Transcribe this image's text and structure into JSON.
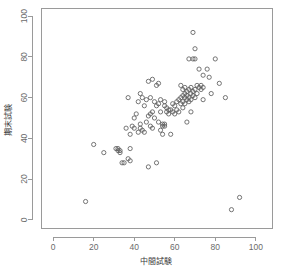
{
  "chart_data": {
    "type": "scatter",
    "title": "",
    "xlabel": "中間試験",
    "ylabel": "期末試験",
    "xlim": [
      -6,
      108
    ],
    "ylim": [
      -4,
      104
    ],
    "xticks": [
      0,
      20,
      40,
      60,
      80,
      100
    ],
    "yticks": [
      0,
      20,
      40,
      60,
      80,
      100
    ],
    "xtick_labels": [
      "0",
      "20",
      "40",
      "60",
      "80",
      "100"
    ],
    "ytick_labels": [
      "0",
      "20",
      "40",
      "60",
      "80",
      "100"
    ],
    "grid": false,
    "legend": false,
    "marker": "open-circle",
    "marker_color": "#5d5d5d",
    "marker_radius": 2.1,
    "n_points": 112,
    "points": [
      [
        16,
        9
      ],
      [
        20,
        37
      ],
      [
        25,
        33
      ],
      [
        31,
        35
      ],
      [
        32,
        35
      ],
      [
        32,
        34
      ],
      [
        33,
        34
      ],
      [
        33,
        33
      ],
      [
        34,
        28
      ],
      [
        35,
        28
      ],
      [
        36,
        45
      ],
      [
        37,
        60
      ],
      [
        37,
        30
      ],
      [
        38,
        35
      ],
      [
        38,
        29
      ],
      [
        38,
        42
      ],
      [
        39,
        46
      ],
      [
        40,
        45
      ],
      [
        40,
        50
      ],
      [
        41,
        52
      ],
      [
        42,
        43
      ],
      [
        42,
        58
      ],
      [
        43,
        62
      ],
      [
        43,
        47
      ],
      [
        43,
        45
      ],
      [
        44,
        44
      ],
      [
        44,
        60
      ],
      [
        45,
        56
      ],
      [
        45,
        43
      ],
      [
        46,
        48
      ],
      [
        46,
        59
      ],
      [
        47,
        26
      ],
      [
        47,
        68
      ],
      [
        47,
        51
      ],
      [
        48,
        60
      ],
      [
        48,
        46
      ],
      [
        48,
        52
      ],
      [
        49,
        69
      ],
      [
        49,
        53
      ],
      [
        49,
        45
      ],
      [
        50,
        58
      ],
      [
        50,
        50
      ],
      [
        51,
        28
      ],
      [
        51,
        66
      ],
      [
        51,
        56
      ],
      [
        52,
        67
      ],
      [
        52,
        48
      ],
      [
        52,
        57
      ],
      [
        53,
        44
      ],
      [
        53,
        59
      ],
      [
        53,
        53
      ],
      [
        54,
        42
      ],
      [
        54,
        47
      ],
      [
        54,
        46
      ],
      [
        55,
        47
      ],
      [
        55,
        56
      ],
      [
        55,
        58
      ],
      [
        55,
        46
      ],
      [
        56,
        53
      ],
      [
        56,
        55
      ],
      [
        57,
        54
      ],
      [
        57,
        52
      ],
      [
        58,
        54
      ],
      [
        58,
        42
      ],
      [
        59,
        53
      ],
      [
        59,
        57
      ],
      [
        60,
        52
      ],
      [
        60,
        56
      ],
      [
        61,
        54
      ],
      [
        61,
        58
      ],
      [
        62,
        59
      ],
      [
        62,
        53
      ],
      [
        63,
        66
      ],
      [
        63,
        60
      ],
      [
        63,
        57
      ],
      [
        64,
        64
      ],
      [
        64,
        58
      ],
      [
        64,
        55
      ],
      [
        64,
        61
      ],
      [
        65,
        65
      ],
      [
        65,
        60
      ],
      [
        65,
        57
      ],
      [
        65,
        62
      ],
      [
        66,
        63
      ],
      [
        66,
        59
      ],
      [
        66,
        61
      ],
      [
        66,
        48
      ],
      [
        67,
        64
      ],
      [
        67,
        60
      ],
      [
        67,
        58
      ],
      [
        67,
        79
      ],
      [
        68,
        62
      ],
      [
        68,
        65
      ],
      [
        68,
        59
      ],
      [
        68,
        53
      ],
      [
        69,
        63
      ],
      [
        69,
        79
      ],
      [
        69,
        61
      ],
      [
        69,
        92
      ],
      [
        70,
        79
      ],
      [
        70,
        64
      ],
      [
        70,
        84
      ],
      [
        70,
        60
      ],
      [
        71,
        66
      ],
      [
        71,
        62
      ],
      [
        72,
        65
      ],
      [
        72,
        74
      ],
      [
        73,
        66
      ],
      [
        73,
        64
      ],
      [
        74,
        71
      ],
      [
        74,
        65
      ],
      [
        74,
        59
      ],
      [
        76,
        74
      ],
      [
        77,
        70
      ],
      [
        78,
        62
      ],
      [
        80,
        79
      ],
      [
        82,
        67
      ],
      [
        85,
        60
      ],
      [
        88,
        5
      ],
      [
        92,
        11
      ]
    ]
  },
  "axis_labels": {
    "x": "中間試験",
    "y": "期末試験"
  },
  "colors": {
    "axis": "#9a9a9a",
    "tick_text": "#6b6b6b",
    "label_text": "#3a3a3a",
    "marker": "#5d5d5d",
    "background": "#ffffff"
  }
}
